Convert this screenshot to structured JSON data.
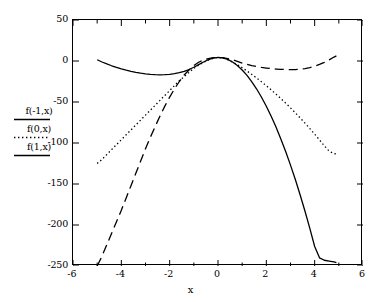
{
  "chart_data": {
    "type": "line",
    "title": "",
    "subtitle": "",
    "xlabel": "x",
    "ylabel": "",
    "xlim": [
      -6,
      6
    ],
    "ylim": [
      -250,
      50
    ],
    "xticks": [
      -6,
      -4,
      -2,
      0,
      2,
      4,
      6
    ],
    "xtick_labels": [
      "-6",
      "-4",
      "-2",
      "0",
      "2",
      "4",
      "6"
    ],
    "xminor_ticks": [
      -5,
      -3,
      -1,
      1,
      3,
      5
    ],
    "yticks": [
      50,
      0,
      -50,
      -100,
      -150,
      -200,
      -250
    ],
    "ytick_labels": [
      "50",
      "0",
      "-50",
      "-100",
      "-150",
      "-200",
      "-250"
    ],
    "grid": false,
    "legend_position": "outside-left",
    "frame_color": "#000000",
    "background": "#ffffff",
    "series": [
      {
        "name": "f(-1,x)",
        "style": "long-dash",
        "color": "#000000",
        "x": [
          -5.0,
          -4.8,
          -4.6,
          -4.4,
          -4.2,
          -4.0,
          -3.8,
          -3.6,
          -3.4,
          -3.2,
          -3.0,
          -2.8,
          -2.6,
          -2.4,
          -2.2,
          -2.0,
          -1.8,
          -1.6,
          -1.4,
          -1.2,
          -1.0,
          -0.8,
          -0.6,
          -0.4,
          -0.2,
          0.0,
          0.2,
          0.4,
          0.6,
          0.8,
          1.0,
          1.2,
          1.4,
          1.6,
          1.8,
          2.0,
          2.2,
          2.4,
          2.6,
          2.8,
          3.0,
          3.2,
          3.4,
          3.6,
          3.8,
          4.0,
          4.2,
          4.4,
          4.6,
          4.8,
          4.9
        ],
        "y": [
          -250,
          -238,
          -224,
          -210,
          -196,
          -182,
          -167,
          -152,
          -137,
          -122,
          -107,
          -93,
          -80,
          -67,
          -55,
          -44,
          -34,
          -25,
          -17,
          -11,
          -5.5,
          -1.5,
          1.2,
          3.0,
          4.0,
          4.3,
          4.0,
          3.0,
          1.5,
          -0.5,
          -2.5,
          -4.2,
          -5.6,
          -6.8,
          -7.8,
          -8.6,
          -9.3,
          -9.8,
          -10.2,
          -10.4,
          -10.5,
          -10.4,
          -10.0,
          -9.2,
          -8.0,
          -6.3,
          -4.2,
          -1.6,
          1.4,
          4.8,
          6.2
        ]
      },
      {
        "name": "f(0,x)",
        "style": "dotted",
        "color": "#000000",
        "x": [
          -5.0,
          -4.8,
          -4.6,
          -4.4,
          -4.2,
          -4.0,
          -3.8,
          -3.6,
          -3.4,
          -3.2,
          -3.0,
          -2.8,
          -2.6,
          -2.4,
          -2.2,
          -2.0,
          -1.8,
          -1.6,
          -1.4,
          -1.2,
          -1.0,
          -0.8,
          -0.6,
          -0.4,
          -0.2,
          0.0,
          0.2,
          0.4,
          0.6,
          0.8,
          1.0,
          1.2,
          1.4,
          1.6,
          1.8,
          2.0,
          2.2,
          2.4,
          2.6,
          2.8,
          3.0,
          3.2,
          3.4,
          3.6,
          3.8,
          4.0,
          4.2,
          4.4,
          4.6,
          4.8,
          4.9
        ],
        "y": [
          -125,
          -120,
          -114,
          -108,
          -102,
          -96,
          -90,
          -84,
          -78,
          -72,
          -66,
          -60,
          -54,
          -48,
          -42,
          -36,
          -30,
          -24,
          -19,
          -14,
          -9,
          -5,
          -1.5,
          1.2,
          3.3,
          4.3,
          3.6,
          1.6,
          -1.2,
          -4.5,
          -8.2,
          -12.2,
          -16.4,
          -20.8,
          -25.4,
          -30.2,
          -35.2,
          -40.4,
          -45.8,
          -51.4,
          -57.2,
          -63.2,
          -69.4,
          -75.8,
          -82.4,
          -89.2,
          -96.2,
          -103.4,
          -110.0,
          -113.0,
          -113.5
        ]
      },
      {
        "name": "f(1,x)",
        "style": "solid",
        "color": "#000000",
        "x": [
          -5.0,
          -4.8,
          -4.6,
          -4.4,
          -4.2,
          -4.0,
          -3.8,
          -3.6,
          -3.4,
          -3.2,
          -3.0,
          -2.8,
          -2.6,
          -2.4,
          -2.2,
          -2.0,
          -1.8,
          -1.6,
          -1.4,
          -1.2,
          -1.0,
          -0.8,
          -0.6,
          -0.4,
          -0.2,
          0.0,
          0.2,
          0.4,
          0.6,
          0.8,
          1.0,
          1.2,
          1.4,
          1.6,
          1.8,
          2.0,
          2.2,
          2.4,
          2.6,
          2.8,
          3.0,
          3.2,
          3.4,
          3.6,
          3.8,
          4.0,
          4.2,
          4.4,
          4.6,
          4.8,
          4.9
        ],
        "y": [
          1.5,
          -1.2,
          -3.6,
          -5.8,
          -7.8,
          -9.6,
          -11.2,
          -12.6,
          -13.8,
          -14.8,
          -15.6,
          -16.2,
          -16.6,
          -16.8,
          -16.7,
          -16.3,
          -15.5,
          -14.3,
          -12.6,
          -10.4,
          -7.6,
          -4.4,
          -1.2,
          1.6,
          3.5,
          4.3,
          3.8,
          2.0,
          -1.2,
          -5.6,
          -11.0,
          -17.6,
          -25.4,
          -34.2,
          -44.2,
          -55.2,
          -67.4,
          -80.6,
          -95.0,
          -110.4,
          -127.0,
          -144.6,
          -163.4,
          -183.2,
          -204.2,
          -226.2,
          -240.0,
          -243.0,
          -244.0,
          -245.0,
          -246.0
        ]
      }
    ],
    "legend": [
      {
        "label": "f(-1,x)",
        "style": "solid"
      },
      {
        "label": "f(0,x)",
        "style": "dotted"
      },
      {
        "label": "f(1,x)",
        "style": "solid"
      }
    ]
  }
}
